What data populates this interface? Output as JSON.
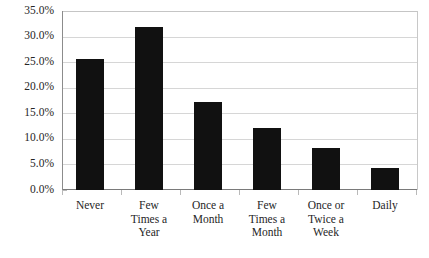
{
  "chart_data": {
    "type": "bar",
    "title": "",
    "subtitle": "",
    "xlabel": "",
    "ylabel": "",
    "categories": [
      "Never",
      "Few Times a Year",
      "Once a Month",
      "Few Times a Month",
      "Once or Twice a Week",
      "Daily"
    ],
    "category_lines": [
      [
        "Never"
      ],
      [
        "Few",
        "Times a",
        "Year"
      ],
      [
        "Once a",
        "Month"
      ],
      [
        "Few",
        "Times a",
        "Month"
      ],
      [
        "Once or",
        "Twice a",
        "Week"
      ],
      [
        "Daily"
      ]
    ],
    "values": [
      25.7,
      32.0,
      17.3,
      12.2,
      8.2,
      4.4
    ],
    "value_labels": [
      "25.7%",
      "32.0%",
      "17.3%",
      "12.2%",
      "8.2%",
      "4.4%"
    ],
    "ylim": [
      0,
      35
    ],
    "ytick_values": [
      0,
      5,
      10,
      15,
      20,
      25,
      30,
      35
    ],
    "ytick_labels": [
      "0.0%",
      "5.0%",
      "10.0%",
      "15.0%",
      "20.0%",
      "25.0%",
      "30.0%",
      "35.0%"
    ],
    "grid": true,
    "legend": false,
    "bar_color": "#111111",
    "grid_color": "#d6d6d6",
    "axis_color": "#7a7a7a",
    "background_color": "#ffffff"
  }
}
